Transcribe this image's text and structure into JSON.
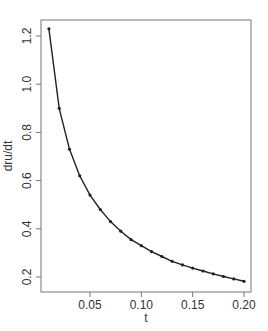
{
  "chart_data": {
    "type": "line",
    "title": "",
    "xlabel": "t",
    "ylabel": "dru/dt",
    "xlim": [
      0.0,
      0.205
    ],
    "ylim": [
      0.15,
      1.26
    ],
    "xticks": [
      0.05,
      0.1,
      0.15,
      0.2
    ],
    "xtick_labels": [
      "0.05",
      "0.10",
      "0.15",
      "0.20"
    ],
    "yticks": [
      0.2,
      0.4,
      0.6,
      0.8,
      1.0,
      1.2
    ],
    "ytick_labels": [
      "0.2",
      "0.4",
      "0.6",
      "0.8",
      "1.0",
      "1.2"
    ],
    "grid": false,
    "legend": null,
    "series": [
      {
        "name": "dru/dt",
        "marker": "dot",
        "color": "#222222",
        "x": [
          0.01,
          0.02,
          0.03,
          0.04,
          0.05,
          0.06,
          0.07,
          0.08,
          0.09,
          0.1,
          0.11,
          0.12,
          0.13,
          0.14,
          0.15,
          0.16,
          0.17,
          0.18,
          0.19,
          0.2
        ],
        "y": [
          1.23,
          0.9,
          0.73,
          0.62,
          0.54,
          0.48,
          0.43,
          0.39,
          0.355,
          0.33,
          0.305,
          0.285,
          0.265,
          0.25,
          0.237,
          0.225,
          0.213,
          0.202,
          0.192,
          0.182
        ]
      }
    ]
  }
}
